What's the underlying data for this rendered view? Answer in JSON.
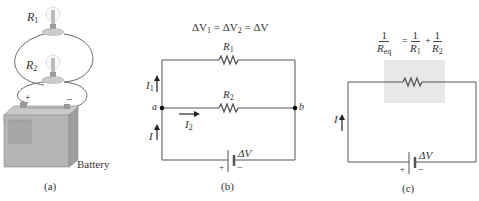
{
  "panels": {
    "a": {
      "caption": "(a)",
      "bulb_labels": [
        "R",
        "R"
      ],
      "bulb_subscripts": [
        "1",
        "2"
      ],
      "battery_label": "Battery",
      "plus": "+",
      "minus": "−"
    },
    "b": {
      "caption": "(b)",
      "equation": {
        "dv": "ΔV",
        "s1": "1",
        "s2": "2",
        "eq": "=",
        "rhs": "ΔV"
      },
      "r1": {
        "label": "R",
        "sub": "1"
      },
      "r2": {
        "label": "R",
        "sub": "2"
      },
      "node_a": "a",
      "node_b": "b",
      "i1": {
        "label": "I",
        "sub": "1"
      },
      "i2": {
        "label": "I",
        "sub": "2"
      },
      "i": "I",
      "battery": {
        "dv": "ΔV",
        "plus": "+",
        "minus": "−"
      }
    },
    "c": {
      "caption": "(c)",
      "equation": {
        "lhs_num": "1",
        "lhs_den": "R",
        "lhs_den_sub": "eq",
        "eq": "=",
        "t1_num": "1",
        "t1_den": "R",
        "t1_sub": "1",
        "plus": "+",
        "t2_num": "1",
        "t2_den": "R",
        "t2_sub": "2"
      },
      "i": "I",
      "battery": {
        "dv": "ΔV",
        "plus": "+",
        "minus": "−"
      }
    }
  },
  "colors": {
    "wire": "#555555",
    "shade": "#e8e8e8",
    "text": "#333333"
  }
}
